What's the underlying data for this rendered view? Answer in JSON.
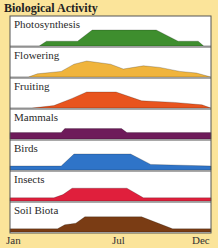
{
  "chart_data": {
    "type": "area",
    "title": "Biological Activity",
    "xlabel": "",
    "ylabel": "",
    "x_tick_labels": [
      "Jan",
      "Jul",
      "Dec"
    ],
    "x_range": [
      0,
      11
    ],
    "grid": false,
    "legend": "none (panel labels inside each strip)",
    "layout": "small multiples, 7 stacked horizontal strips sharing x axis",
    "series": [
      {
        "name": "Photosynthesis",
        "color": "#3e8e2e",
        "points": [
          [
            0,
            0
          ],
          [
            1.6,
            0
          ],
          [
            2,
            0.3
          ],
          [
            3.7,
            0.3
          ],
          [
            4.5,
            1
          ],
          [
            8,
            1
          ],
          [
            9.2,
            0.3
          ],
          [
            10.3,
            0.3
          ],
          [
            10.6,
            0
          ],
          [
            11,
            0
          ]
        ]
      },
      {
        "name": "Flowering",
        "color": "#f0b43c",
        "points": [
          [
            0,
            0
          ],
          [
            1,
            0
          ],
          [
            1.5,
            0.2
          ],
          [
            2.8,
            0.35
          ],
          [
            3.5,
            0.8
          ],
          [
            4.2,
            1
          ],
          [
            5.5,
            0.8
          ],
          [
            6.2,
            0.5
          ],
          [
            7.3,
            0.7
          ],
          [
            8.2,
            0.6
          ],
          [
            9.3,
            0.35
          ],
          [
            10.2,
            0.25
          ],
          [
            11,
            0
          ]
        ]
      },
      {
        "name": "Fruiting",
        "color": "#e8541e",
        "points": [
          [
            0,
            0
          ],
          [
            1.2,
            0
          ],
          [
            2.4,
            0.15
          ],
          [
            3.4,
            0.6
          ],
          [
            4.2,
            1
          ],
          [
            5.8,
            1
          ],
          [
            7.2,
            0.45
          ],
          [
            9,
            0.35
          ],
          [
            10.5,
            0.2
          ],
          [
            11,
            0
          ]
        ]
      },
      {
        "name": "Mammals",
        "color": "#6e1b5a",
        "points": [
          [
            0,
            0.4
          ],
          [
            2.8,
            0.4
          ],
          [
            3,
            0.65
          ],
          [
            6.1,
            0.65
          ],
          [
            6.4,
            0.4
          ],
          [
            11,
            0.4
          ]
        ]
      },
      {
        "name": "Birds",
        "color": "#2f74c8",
        "points": [
          [
            0,
            0.25
          ],
          [
            2.8,
            0.25
          ],
          [
            3.5,
            1
          ],
          [
            6.6,
            1
          ],
          [
            7.7,
            0.35
          ],
          [
            11,
            0.25
          ]
        ]
      },
      {
        "name": "Insects",
        "color": "#e01f3c",
        "points": [
          [
            0,
            0.2
          ],
          [
            2.4,
            0.2
          ],
          [
            2.9,
            0.4
          ],
          [
            3.4,
            0.8
          ],
          [
            6.4,
            0.8
          ],
          [
            7.3,
            0.2
          ],
          [
            11,
            0.2
          ]
        ]
      },
      {
        "name": "Soil Biota",
        "color": "#7a3c14",
        "points": [
          [
            0,
            0.2
          ],
          [
            2.6,
            0.2
          ],
          [
            3,
            0.45
          ],
          [
            3.6,
            0.55
          ],
          [
            4.1,
            0.95
          ],
          [
            7.2,
            0.95
          ],
          [
            8.9,
            0.2
          ],
          [
            11,
            0.2
          ]
        ]
      }
    ]
  },
  "title": "Biological Activity",
  "axis": {
    "start": "Jan",
    "mid": "Jul",
    "end": "Dec"
  },
  "colors": {
    "background": "#fbe49a",
    "panel": "#ffffff",
    "border": "#555555"
  }
}
